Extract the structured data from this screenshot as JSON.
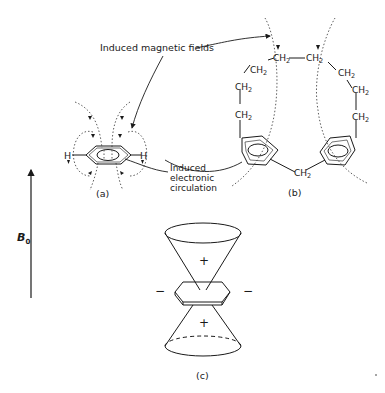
{
  "figure": {
    "annotations": {
      "induced_fields": "Induced magnetic fields",
      "electronic_circulation": [
        "Induced",
        "electronic",
        "circulation"
      ]
    },
    "panels": {
      "a": {
        "label": "(a)",
        "atoms": [
          "H",
          "H"
        ]
      },
      "b": {
        "label": "(b)",
        "group": "CH",
        "group_subscript": "2",
        "chain_count": 9
      },
      "c": {
        "label": "(c)",
        "signs": {
          "top_cone": "+",
          "bottom_cone": "+",
          "left": "−",
          "right": "−"
        }
      }
    },
    "field": {
      "symbol": "B",
      "subscript": "0",
      "direction": "up"
    },
    "colors": {
      "ink": "#1a1a1a",
      "background": "#ffffff"
    }
  }
}
